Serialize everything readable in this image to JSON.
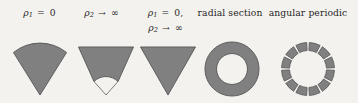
{
  "figure": {
    "background_color": "#f4f2ee",
    "shape_fill_color": "#808080",
    "shape_stroke_color": "#5d5d5d",
    "panel_count": 5
  },
  "labels": {
    "panel_1": {
      "line_1_symbol": "ρ",
      "line_1_subscript": "1",
      "line_1_relation": "=",
      "line_1_value": "0",
      "plain": "ρ₁ = 0"
    },
    "panel_2": {
      "line_1_symbol": "ρ",
      "line_1_subscript": "2",
      "line_1_relation": "→",
      "line_1_value": "∞",
      "plain": "ρ₂ → ∞"
    },
    "panel_3": {
      "line_1_symbol": "ρ",
      "line_1_subscript": "1",
      "line_1_relation": "=",
      "line_1_value": "0,",
      "line_2_symbol": "ρ",
      "line_2_subscript": "2",
      "line_2_relation": "→",
      "line_2_value": "∞",
      "plain": "ρ₁ = 0, ρ₂ → ∞"
    },
    "panel_4": {
      "text": "radial section"
    },
    "panel_5": {
      "text": "angular periodic"
    }
  },
  "shapes": {
    "panel_1": {
      "name": "circular-sector",
      "description": "filled circular sector (wedge) with curved outer arc at top, apex pointing down"
    },
    "panel_2": {
      "name": "truncated-sector-with-arc-notch",
      "description": "filled wedge with a small arc notch removed near the apex, thin outline to apex"
    },
    "panel_3": {
      "name": "triangle-sector",
      "description": "filled triangular sector with flat top, apex pointing down"
    },
    "panel_4": {
      "name": "annulus",
      "description": "filled ring (annulus) between inner and outer radius"
    },
    "panel_5": {
      "name": "segmented-annulus",
      "description": "ring divided into separated angular segments",
      "segment_count": 12
    }
  }
}
